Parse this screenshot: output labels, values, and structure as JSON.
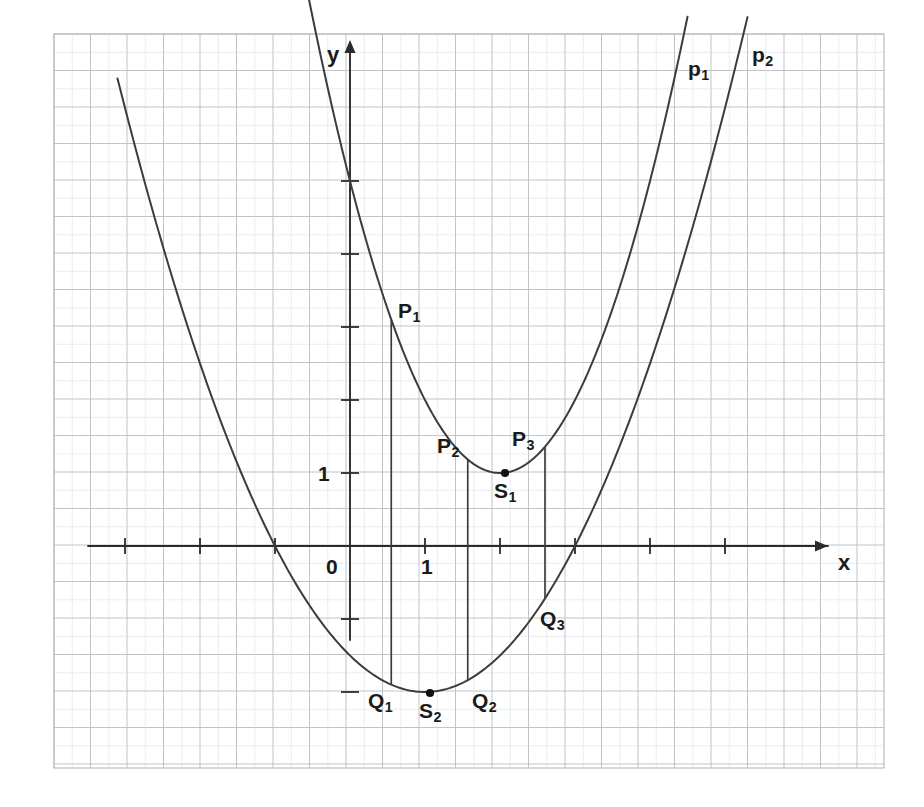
{
  "figure": {
    "kind": "graph-paper-parabolas",
    "background": "#ffffff",
    "grid_color": "#b9bcc2",
    "grid_minor_color": "#d9dce1",
    "curve_color": "#3c3c3c",
    "axis_color": "#2b2b2b",
    "label_color": "#1a1a1a"
  },
  "axes": {
    "x_label": "x",
    "y_label": "y",
    "x_tick_label": "1",
    "y_tick_label": "1",
    "origin_label": "0",
    "x_range": [
      -3.6,
      7.1
    ],
    "y_range": [
      -3.1,
      7.0
    ],
    "x_unit_px": 75,
    "y_unit_px": 73,
    "origin_px": [
      350,
      546
    ],
    "x_ticks": [
      -3,
      -2,
      -1,
      1,
      2,
      3,
      4,
      5
    ],
    "y_ticks": [
      -2,
      -1,
      1,
      2,
      3,
      4,
      5
    ]
  },
  "curves": [
    {
      "name": "p1",
      "label": "p₁",
      "label_text": "p",
      "label_sub": "1",
      "equation": "y = (x - 2)^2 + 1",
      "a": 1.0,
      "vertex": [
        2,
        1
      ],
      "domain": [
        -1.2,
        4.5
      ],
      "label_px": [
        688,
        58
      ]
    },
    {
      "name": "p2",
      "label": "p₂",
      "label_text": "p",
      "label_sub": "2",
      "equation": "y = 0.5(x - 1)^2 - 2",
      "a": 0.5,
      "vertex": [
        1,
        -2
      ],
      "roots": [
        -1,
        3
      ],
      "domain": [
        -3.1,
        5.3
      ],
      "label_px": [
        752,
        44
      ]
    }
  ],
  "points": [
    {
      "id": "P1",
      "text": "P",
      "sub": "1",
      "on": "p1",
      "x": 0.55,
      "y": 3.1,
      "label_px": [
        398,
        300
      ],
      "dot": false
    },
    {
      "id": "P2",
      "text": "P",
      "sub": "2",
      "on": "p1",
      "x": 1.57,
      "y": 1.18,
      "label_px": [
        437,
        435
      ],
      "dot": false
    },
    {
      "id": "P3",
      "text": "P",
      "sub": "3",
      "on": "p1",
      "x": 2.6,
      "y": 1.36,
      "label_px": [
        512,
        428
      ],
      "dot": false
    },
    {
      "id": "S1",
      "text": "S",
      "sub": "1",
      "on": "p1",
      "x": 2,
      "y": 1,
      "label_px": [
        494,
        480
      ],
      "dot": true,
      "dot_px": [
        505,
        473
      ]
    },
    {
      "id": "Q1",
      "text": "Q",
      "sub": "1",
      "on": "p2",
      "x": 0.55,
      "y": -1.9,
      "label_px": [
        368,
        690
      ],
      "dot": false
    },
    {
      "id": "Q2",
      "text": "Q",
      "sub": "2",
      "on": "p2",
      "x": 1.57,
      "y": -1.84,
      "label_px": [
        472,
        690
      ],
      "dot": false
    },
    {
      "id": "S2",
      "text": "S",
      "sub": "2",
      "on": "p2",
      "x": 1,
      "y": -2,
      "label_px": [
        419,
        700
      ],
      "dot": true,
      "dot_px": [
        430,
        693
      ]
    },
    {
      "id": "Q3",
      "text": "Q",
      "sub": "3",
      "on": "p2",
      "x": 2.6,
      "y": -0.72,
      "label_px": [
        540,
        608
      ],
      "dot": false
    }
  ],
  "connector_lines": [
    {
      "id": "P1-Q1",
      "x": 0.55,
      "from_y": 3.1,
      "to_y": -1.9
    },
    {
      "id": "P2-Q2",
      "x": 1.57,
      "from_y": 1.18,
      "to_y": -1.84
    },
    {
      "id": "P3-Q3",
      "x": 2.6,
      "from_y": 1.36,
      "to_y": -0.72
    }
  ],
  "chart_data": {
    "type": "line",
    "title": "",
    "xlabel": "x",
    "ylabel": "y",
    "xlim": [
      -3.6,
      7.1
    ],
    "ylim": [
      -3.1,
      7.0
    ],
    "grid": true,
    "legend": "inline-curve-labels",
    "series": [
      {
        "name": "p₁",
        "equation": "y = (x - 2)² + 1",
        "vertex": [
          2,
          1
        ],
        "x": [
          -1.2,
          -0.8,
          -0.4,
          0,
          0.4,
          0.8,
          1.2,
          1.6,
          2,
          2.4,
          2.8,
          3.2,
          3.6,
          4,
          4.4
        ],
        "values": [
          11.24,
          8.84,
          6.76,
          5,
          3.56,
          2.44,
          1.64,
          1.16,
          1,
          1.16,
          1.64,
          2.44,
          3.56,
          5,
          6.76
        ]
      },
      {
        "name": "p₂",
        "equation": "y = 0.5(x - 1)² - 2",
        "vertex": [
          1,
          -2
        ],
        "roots": [
          -1,
          3
        ],
        "x": [
          -3,
          -2.5,
          -2,
          -1.5,
          -1,
          -0.5,
          0,
          0.5,
          1,
          1.5,
          2,
          2.5,
          3,
          3.5,
          4,
          4.5,
          5
        ],
        "values": [
          6,
          4.125,
          2.5,
          1.125,
          0,
          -0.875,
          -1.5,
          -1.875,
          -2,
          -1.875,
          -1.5,
          -0.875,
          0,
          1.125,
          2.5,
          4.125,
          6
        ]
      }
    ],
    "annotations": [
      {
        "label": "P₁",
        "x": 0.55,
        "y": 3.1
      },
      {
        "label": "P₂",
        "x": 1.57,
        "y": 1.18
      },
      {
        "label": "P₃",
        "x": 2.6,
        "y": 1.36
      },
      {
        "label": "S₁",
        "x": 2,
        "y": 1
      },
      {
        "label": "Q₁",
        "x": 0.55,
        "y": -1.9
      },
      {
        "label": "Q₂",
        "x": 1.57,
        "y": -1.84
      },
      {
        "label": "Q₃",
        "x": 2.6,
        "y": -0.72
      },
      {
        "label": "S₂",
        "x": 1,
        "y": -2
      }
    ]
  }
}
